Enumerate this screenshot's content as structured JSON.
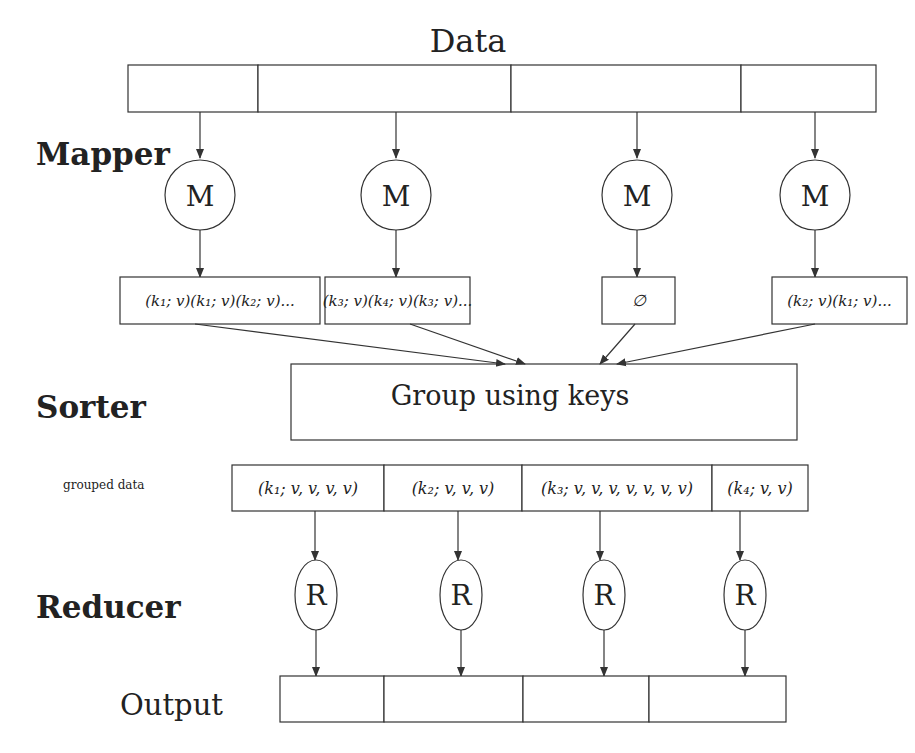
{
  "title": "Data",
  "stages": {
    "mapper": "Mapper",
    "sorter": "Sorter",
    "reducer": "Reducer",
    "output": "Output",
    "grouped_label": "grouped data"
  },
  "data_cells": [
    {
      "x": 128,
      "w": 130
    },
    {
      "x": 258,
      "w": 253
    },
    {
      "x": 511,
      "w": 230
    },
    {
      "x": 741,
      "w": 135
    }
  ],
  "mappers": [
    {
      "label": "M",
      "cx": 200,
      "output": "(k₁; v)(k₁; v)(k₂; v)...",
      "box": {
        "x": 120,
        "w": 200
      }
    },
    {
      "label": "M",
      "cx": 396,
      "output": "(k₃; v)(k₄; v)(k₃; v)...",
      "box": {
        "x": 325,
        "w": 145
      }
    },
    {
      "label": "M",
      "cx": 637,
      "output": "∅",
      "box": {
        "x": 602,
        "w": 73
      }
    },
    {
      "label": "M",
      "cx": 815,
      "output": "(k₂; v)(k₁; v)...",
      "box": {
        "x": 772,
        "w": 135
      }
    }
  ],
  "sorter_box_label": "Group using keys",
  "grouped_cells": [
    {
      "text": "(k₁; v, v, v, v)",
      "x": 232,
      "w": 152,
      "cx": 315
    },
    {
      "text": "(k₂; v, v, v)",
      "x": 384,
      "w": 138,
      "cx": 458
    },
    {
      "text": "(k₃; v, v, v, v, v, v, v)",
      "x": 522,
      "w": 190,
      "cx": 600
    },
    {
      "text": "(k₄; v, v)",
      "x": 712,
      "w": 96,
      "cx": 740
    }
  ],
  "reducers": [
    {
      "label": "R",
      "cx": 316
    },
    {
      "label": "R",
      "cx": 461
    },
    {
      "label": "R",
      "cx": 604
    },
    {
      "label": "R",
      "cx": 745
    }
  ],
  "output_cells": [
    {
      "x": 280,
      "w": 104
    },
    {
      "x": 384,
      "w": 139
    },
    {
      "x": 523,
      "w": 126
    },
    {
      "x": 649,
      "w": 137
    }
  ],
  "colors": {
    "stroke": "#333333",
    "text": "#222222",
    "background": "#ffffff"
  }
}
